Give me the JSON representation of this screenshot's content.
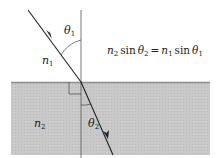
{
  "diagram": {
    "type": "refraction / Snell's law",
    "media": {
      "upper": {
        "label": "n",
        "subscript": "1",
        "color": "#ffffff"
      },
      "lower": {
        "label": "n",
        "subscript": "2",
        "color": "#c8c8c8"
      }
    },
    "angles": {
      "incident": {
        "symbol": "θ",
        "subscript": "1"
      },
      "refracted": {
        "symbol": "θ",
        "subscript": "2"
      }
    },
    "equation": {
      "lhs_n": "n",
      "lhs_n_sub": "2",
      "lhs_sin": "sin",
      "lhs_theta": "θ",
      "lhs_theta_sub": "2",
      "equals": "=",
      "rhs_n": "n",
      "rhs_n_sub": "1",
      "rhs_sin": "sin",
      "rhs_theta": "θ",
      "rhs_theta_sub": "1"
    },
    "colors": {
      "line": "#222222",
      "medium2": "#c8c8c8",
      "interface": "#8a8a8a"
    }
  }
}
